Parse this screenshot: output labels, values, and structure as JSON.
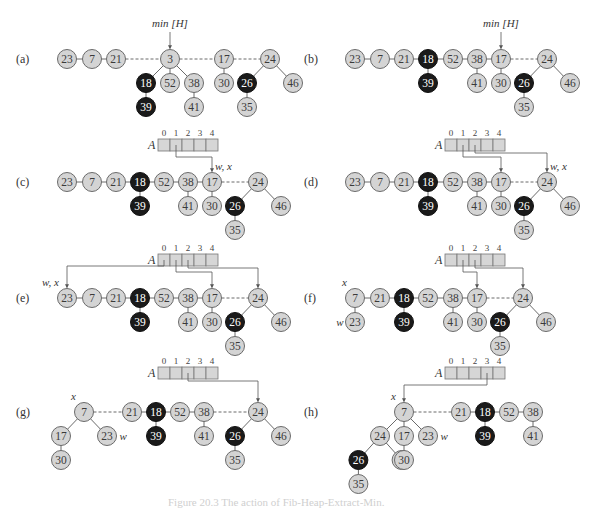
{
  "figure": {
    "caption": "Figure 20.3  The action of Fib-Heap-Extract-Min.",
    "colors": {
      "light_node_fill": "#d4d4d4",
      "light_node_stroke": "#6a6a6a",
      "dark_node_fill": "#1a1a1a",
      "dark_node_text": "#ffffff",
      "light_node_text": "#3a3a3a",
      "edge": "#6a6a6a",
      "array_fill": "#d6d6d6"
    },
    "min_label": "min [H]",
    "array_label": "A",
    "array_indices": [
      "0",
      "1",
      "2",
      "3",
      "4"
    ],
    "panels": [
      {
        "id": "a",
        "label": "(a)",
        "min_pointer_to": "3",
        "roots": [
          {
            "key": "23"
          },
          {
            "key": "7"
          },
          {
            "key": "21"
          },
          {
            "key": "3",
            "children": [
              {
                "key": "18",
                "marked": true,
                "children": [
                  {
                    "key": "39",
                    "marked": true
                  }
                ]
              },
              {
                "key": "52"
              },
              {
                "key": "38",
                "children": [
                  {
                    "key": "41"
                  }
                ]
              }
            ]
          },
          {
            "key": "17",
            "children": [
              {
                "key": "30"
              }
            ]
          },
          {
            "key": "24",
            "children": [
              {
                "key": "26",
                "marked": true,
                "children": [
                  {
                    "key": "35"
                  }
                ]
              },
              {
                "key": "46"
              }
            ]
          }
        ]
      },
      {
        "id": "b",
        "label": "(b)",
        "min_pointer_to": "17",
        "roots": [
          {
            "key": "23"
          },
          {
            "key": "7"
          },
          {
            "key": "21"
          },
          {
            "key": "18",
            "marked": true,
            "children": [
              {
                "key": "39",
                "marked": true
              }
            ]
          },
          {
            "key": "52"
          },
          {
            "key": "38",
            "children": [
              {
                "key": "41"
              }
            ]
          },
          {
            "key": "17",
            "children": [
              {
                "key": "30"
              }
            ]
          },
          {
            "key": "24",
            "children": [
              {
                "key": "26",
                "marked": true,
                "children": [
                  {
                    "key": "35"
                  }
                ]
              },
              {
                "key": "46"
              }
            ]
          }
        ]
      },
      {
        "id": "c",
        "label": "(c)",
        "pointer_labels": [
          {
            "node": "17",
            "text": "w, x"
          }
        ],
        "array_pointers": [
          {
            "index": 1,
            "to": "17"
          }
        ],
        "roots": [
          {
            "key": "23"
          },
          {
            "key": "7"
          },
          {
            "key": "21"
          },
          {
            "key": "18",
            "marked": true,
            "children": [
              {
                "key": "39",
                "marked": true
              }
            ]
          },
          {
            "key": "52"
          },
          {
            "key": "38",
            "children": [
              {
                "key": "41"
              }
            ]
          },
          {
            "key": "17",
            "children": [
              {
                "key": "30"
              }
            ]
          },
          {
            "key": "24",
            "children": [
              {
                "key": "26",
                "marked": true,
                "children": [
                  {
                    "key": "35"
                  }
                ]
              },
              {
                "key": "46"
              }
            ]
          }
        ]
      },
      {
        "id": "d",
        "label": "(d)",
        "pointer_labels": [
          {
            "node": "24",
            "text": "w, x"
          }
        ],
        "array_pointers": [
          {
            "index": 1,
            "to": "17"
          },
          {
            "index": 2,
            "to": "24"
          }
        ],
        "roots": [
          {
            "key": "23"
          },
          {
            "key": "7"
          },
          {
            "key": "21"
          },
          {
            "key": "18",
            "marked": true,
            "children": [
              {
                "key": "39",
                "marked": true
              }
            ]
          },
          {
            "key": "52"
          },
          {
            "key": "38",
            "children": [
              {
                "key": "41"
              }
            ]
          },
          {
            "key": "17",
            "children": [
              {
                "key": "30"
              }
            ]
          },
          {
            "key": "24",
            "children": [
              {
                "key": "26",
                "marked": true,
                "children": [
                  {
                    "key": "35"
                  }
                ]
              },
              {
                "key": "46"
              }
            ]
          }
        ]
      },
      {
        "id": "e",
        "label": "(e)",
        "pointer_labels": [
          {
            "node": "23",
            "text": "w, x"
          }
        ],
        "array_pointers": [
          {
            "index": 0,
            "to": "23"
          },
          {
            "index": 1,
            "to": "17"
          },
          {
            "index": 2,
            "to": "24"
          }
        ],
        "roots": [
          {
            "key": "23"
          },
          {
            "key": "7"
          },
          {
            "key": "21"
          },
          {
            "key": "18",
            "marked": true,
            "children": [
              {
                "key": "39",
                "marked": true
              }
            ]
          },
          {
            "key": "52"
          },
          {
            "key": "38",
            "children": [
              {
                "key": "41"
              }
            ]
          },
          {
            "key": "17",
            "children": [
              {
                "key": "30"
              }
            ]
          },
          {
            "key": "24",
            "children": [
              {
                "key": "26",
                "marked": true,
                "children": [
                  {
                    "key": "35"
                  }
                ]
              },
              {
                "key": "46"
              }
            ]
          }
        ]
      },
      {
        "id": "f",
        "label": "(f)",
        "pointer_labels": [
          {
            "node": "7",
            "text": "x"
          },
          {
            "node": "23",
            "text": "w"
          }
        ],
        "array_pointers": [
          {
            "index": 1,
            "to": "17"
          },
          {
            "index": 2,
            "to": "24"
          }
        ],
        "roots": [
          {
            "key": "7",
            "children": [
              {
                "key": "23"
              }
            ]
          },
          {
            "key": "21"
          },
          {
            "key": "18",
            "marked": true,
            "children": [
              {
                "key": "39",
                "marked": true
              }
            ]
          },
          {
            "key": "52"
          },
          {
            "key": "38",
            "children": [
              {
                "key": "41"
              }
            ]
          },
          {
            "key": "17",
            "children": [
              {
                "key": "30"
              }
            ]
          },
          {
            "key": "24",
            "children": [
              {
                "key": "26",
                "marked": true,
                "children": [
                  {
                    "key": "35"
                  }
                ]
              },
              {
                "key": "46"
              }
            ]
          }
        ]
      },
      {
        "id": "g",
        "label": "(g)",
        "pointer_labels": [
          {
            "node": "7",
            "text": "x"
          },
          {
            "node": "23",
            "text": "w"
          }
        ],
        "array_pointers": [
          {
            "index": 2,
            "to": "24"
          }
        ],
        "roots": [
          {
            "key": "7",
            "children": [
              {
                "key": "17",
                "children": [
                  {
                    "key": "30"
                  }
                ]
              },
              {
                "key": "23"
              }
            ]
          },
          {
            "key": "21"
          },
          {
            "key": "18",
            "marked": true,
            "children": [
              {
                "key": "39",
                "marked": true
              }
            ]
          },
          {
            "key": "52"
          },
          {
            "key": "38",
            "children": [
              {
                "key": "41"
              }
            ]
          },
          {
            "key": "24",
            "children": [
              {
                "key": "26",
                "marked": true,
                "children": [
                  {
                    "key": "35"
                  }
                ]
              },
              {
                "key": "46"
              }
            ]
          }
        ]
      },
      {
        "id": "h",
        "label": "(h)",
        "pointer_labels": [
          {
            "node": "7",
            "text": "x"
          },
          {
            "node": "23",
            "text": "w"
          }
        ],
        "array_pointers": [
          {
            "index": 3,
            "to": "7"
          }
        ],
        "roots": [
          {
            "key": "7",
            "children": [
              {
                "key": "24",
                "children": [
                  {
                    "key": "26",
                    "marked": true,
                    "children": [
                      {
                        "key": "35"
                      }
                    ]
                  },
                  {
                    "key": "46"
                  }
                ]
              },
              {
                "key": "17",
                "children": [
                  {
                    "key": "30"
                  }
                ]
              },
              {
                "key": "23"
              }
            ]
          },
          {
            "key": "21"
          },
          {
            "key": "18",
            "marked": true,
            "children": [
              {
                "key": "39",
                "marked": true
              }
            ]
          },
          {
            "key": "52"
          },
          {
            "key": "38",
            "children": [
              {
                "key": "41"
              }
            ]
          }
        ]
      }
    ]
  }
}
